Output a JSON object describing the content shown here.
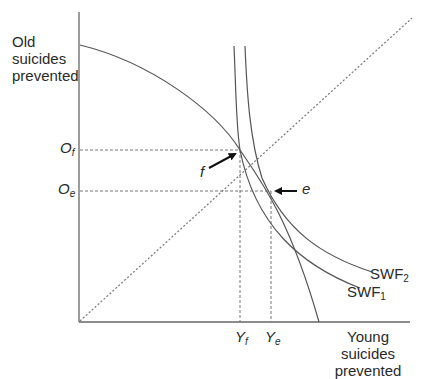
{
  "axes": {
    "y_label_lines": [
      "Old",
      "suicides",
      "prevented"
    ],
    "x_label_lines": [
      "Young suicides",
      "prevented"
    ]
  },
  "points": {
    "f": {
      "label": "f",
      "y_tick": {
        "base": "O",
        "sub": "f"
      },
      "x_tick": {
        "base": "Y",
        "sub": "f"
      }
    },
    "e": {
      "label": "e",
      "y_tick": {
        "base": "O",
        "sub": "e"
      },
      "x_tick": {
        "base": "Y",
        "sub": "e"
      }
    }
  },
  "curves": {
    "swf2": {
      "base": "SWF",
      "sub": "2"
    },
    "swf1": {
      "base": "SWF",
      "sub": "1"
    }
  },
  "colors": {
    "line": "#555555",
    "text": "#2a2a2a",
    "arrow": "#111111"
  }
}
